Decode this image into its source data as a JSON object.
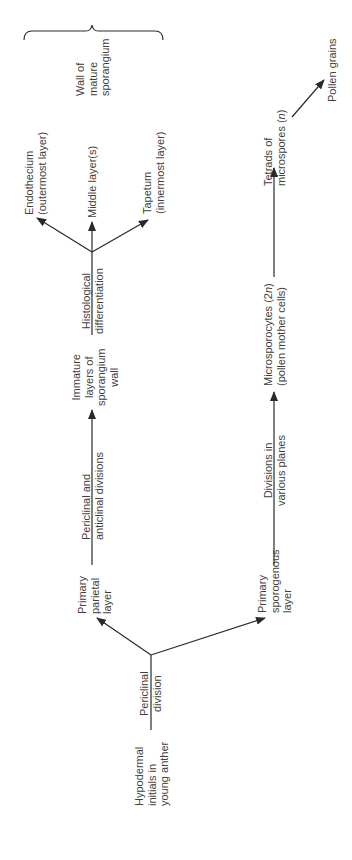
{
  "diagram": {
    "orientation": "rotated 90 degrees counter-clockwise",
    "colors": {
      "line": "#2a2a2a",
      "text": "#3f3f3f",
      "background": "#ffffff"
    },
    "nodes": {
      "hypodermal": {
        "lines": [
          "Hypodermal",
          "initials in",
          "young anther"
        ]
      },
      "parietal": {
        "lines": [
          "Primary",
          "parietal",
          "layer"
        ]
      },
      "sporogenous": {
        "lines": [
          "Primary",
          "sporogenous",
          "layer"
        ]
      },
      "immature": {
        "lines": [
          "Immature",
          "layers of",
          "sporangium",
          "wall"
        ]
      },
      "endothecium": {
        "lines": [
          "Endothecium",
          "(outermost layer)"
        ]
      },
      "middle": {
        "lines": [
          "Middle layer(s)"
        ]
      },
      "tapetum": {
        "lines": [
          "Tapetum",
          "(innermost layer)"
        ]
      },
      "wall_mature": {
        "lines": [
          "Wall of",
          "mature",
          "sporangium"
        ]
      },
      "microsporocytes": {
        "lines": [
          "Microsporocytes (2n)",
          "(pollen mother cells)"
        ]
      },
      "tetrads": {
        "lines": [
          "Tetrads of",
          "microspores (n)"
        ]
      },
      "pollen": {
        "lines": [
          "Pollen grains"
        ]
      }
    },
    "edges": {
      "periclinal_division": {
        "lines": [
          "Periclinal",
          "division"
        ]
      },
      "periclinal_anticlinal": {
        "lines": [
          "Periclinal and",
          "anticlinal divisions"
        ]
      },
      "histological": {
        "lines": [
          "Histological",
          "differentiation"
        ]
      },
      "various_planes": {
        "lines": [
          "Divisions in",
          "various planes"
        ]
      }
    }
  }
}
